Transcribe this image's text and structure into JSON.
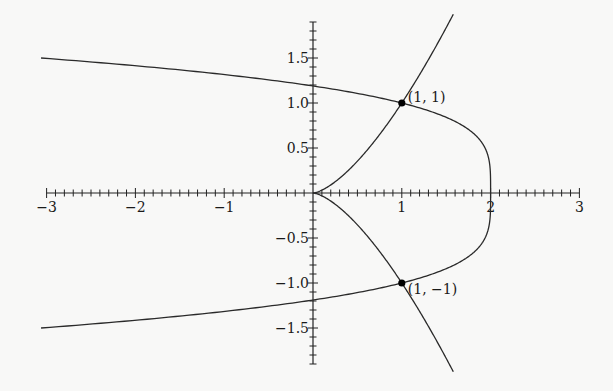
{
  "chart_data": {
    "type": "line",
    "title": "",
    "xlabel": "",
    "ylabel": "",
    "xlim": [
      -3,
      3
    ],
    "ylim": [
      -1.9,
      1.9
    ],
    "grid": false,
    "legend": "none",
    "x_major_ticks": [
      -3,
      -2,
      -1,
      1,
      2,
      3
    ],
    "x_tick_labels": [
      "−3",
      "−2",
      "−1",
      "1",
      "2",
      "3"
    ],
    "x_minor_step": 0.1,
    "y_major_ticks": [
      1.5,
      1.0,
      0.5,
      -0.5,
      -1.0,
      -1.5
    ],
    "y_tick_labels": [
      "1.5",
      "1.0",
      "0.5",
      "−0.5",
      "−1.0",
      "−1.5"
    ],
    "y_minor_step": 0.1,
    "series": [
      {
        "name": "y^2 = x^3",
        "equation": "y² = x³",
        "param": "x from 0 to 1.58, y = ±x^(3/2)",
        "points_upper": [
          [
            0,
            0
          ],
          [
            0.25,
            0.125
          ],
          [
            0.5,
            0.354
          ],
          [
            0.75,
            0.65
          ],
          [
            1,
            1
          ],
          [
            1.25,
            1.398
          ],
          [
            1.5,
            1.837
          ],
          [
            1.58,
            1.986
          ]
        ],
        "points_lower": [
          [
            0,
            0
          ],
          [
            0.25,
            -0.125
          ],
          [
            0.5,
            -0.354
          ],
          [
            0.75,
            -0.65
          ],
          [
            1,
            -1
          ],
          [
            1.25,
            -1.398
          ],
          [
            1.5,
            -1.837
          ],
          [
            1.58,
            -1.986
          ]
        ]
      },
      {
        "name": "x = 2 - y^4",
        "equation": "x = 2 − y⁴",
        "param": "y from -1.5 to 1.5",
        "points": [
          [
            -3.0625,
            -1.5
          ],
          [
            -1.8416,
            -1.4
          ],
          [
            -0.8561,
            -1.3
          ],
          [
            -0.0736,
            -1.2
          ],
          [
            0.5359,
            -1.1
          ],
          [
            1,
            -1
          ],
          [
            1.5904,
            -0.8
          ],
          [
            1.8704,
            -0.6
          ],
          [
            1.9744,
            -0.4
          ],
          [
            2,
            0
          ],
          [
            1.9744,
            0.4
          ],
          [
            1.8704,
            0.6
          ],
          [
            1.5904,
            0.8
          ],
          [
            1,
            1
          ],
          [
            0.5359,
            1.1
          ],
          [
            -0.0736,
            1.2
          ],
          [
            -0.8561,
            1.3
          ],
          [
            -1.8416,
            1.4
          ],
          [
            -3.0625,
            1.5
          ]
        ]
      }
    ],
    "annotations": [
      {
        "x": 1,
        "y": 1,
        "label": "(1, 1)"
      },
      {
        "x": 1,
        "y": -1,
        "label": "(1, −1)"
      }
    ]
  }
}
